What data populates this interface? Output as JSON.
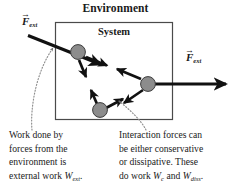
{
  "figure": {
    "environment_label": "Environment",
    "system_label": "System",
    "force_left": {
      "symbol": "F",
      "subscript": "ext",
      "vector_arrow": "→"
    },
    "force_right": {
      "symbol": "F",
      "subscript": "ext",
      "vector_arrow": "→"
    },
    "caption_left": {
      "lines": [
        "Work done by",
        "forces from the",
        "environment is"
      ],
      "last_line_prefix": "external work ",
      "last_line_symbol": "W",
      "last_line_subscript": "ext",
      "last_line_suffix": "."
    },
    "caption_right": {
      "lines": [
        "Interaction forces can",
        "be either conservative",
        "or dissipative. These"
      ],
      "last_line_prefix": "do work ",
      "last_line_symbol1": "W",
      "last_line_subscript1": "c",
      "last_line_middle": " and ",
      "last_line_symbol2": "W",
      "last_line_subscript2": "diss",
      "last_line_suffix": "."
    },
    "colors": {
      "particle_fill": "#8c8c8c",
      "particle_stroke": "#3d3d3d",
      "arrow": "#111111",
      "box_stroke": "#4a4a4a",
      "leader": "#8f8f8f",
      "background": "#ffffff"
    },
    "particles": [
      {
        "name": "particle-top-left",
        "cx": 78,
        "cy": 52,
        "r": 7.5
      },
      {
        "name": "particle-right",
        "cx": 148,
        "cy": 84,
        "r": 7.5
      },
      {
        "name": "particle-bottom",
        "cx": 100,
        "cy": 110,
        "r": 7.5
      }
    ],
    "system_box": {
      "x": 55,
      "y": 22,
      "width": 118,
      "height": 98
    },
    "external_arrows": [
      {
        "name": "external-force-arrow-left",
        "x1": 28,
        "y1": 35,
        "x2": 100,
        "y2": 64
      },
      {
        "name": "external-force-arrow-right",
        "x1": 148,
        "y1": 84,
        "x2": 226,
        "y2": 84
      }
    ],
    "interaction_pairs": [
      {
        "name": "interaction-topleft-right"
      },
      {
        "name": "interaction-right-bottom"
      },
      {
        "name": "interaction-bottom-topleft"
      }
    ]
  }
}
